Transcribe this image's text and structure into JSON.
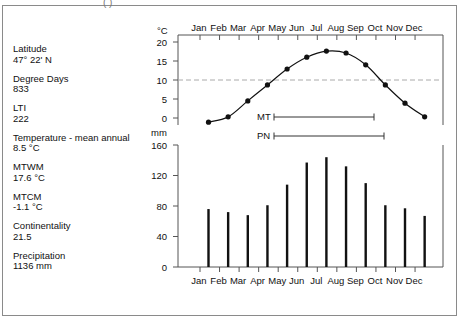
{
  "header": {
    "partial_title": "(          )"
  },
  "info": [
    {
      "label": "Latitude",
      "value": "47° 22'  N"
    },
    {
      "label": "Degree Days",
      "value": "833"
    },
    {
      "label": "LTI",
      "value": "222"
    },
    {
      "label": "Temperature - mean annual",
      "value": "8.5 °C"
    },
    {
      "label": "MTWM",
      "value": "17.6 °C"
    },
    {
      "label": "MTCM",
      "value": "-1.1 °C"
    },
    {
      "label": "Continentality",
      "value": "21.5"
    },
    {
      "label": "Precipitation",
      "value": "1136 mm"
    }
  ],
  "chart_data": [
    {
      "type": "line",
      "title": "Mean monthly temperature",
      "ylabel": "°C",
      "xlabel": "",
      "categories": [
        "Jan",
        "Feb",
        "Mar",
        "Apr",
        "May",
        "Jun",
        "Jul",
        "Aug",
        "Sep",
        "Oct",
        "Nov",
        "Dec"
      ],
      "values": [
        -1.1,
        0.3,
        4.5,
        8.7,
        12.9,
        16.0,
        17.6,
        17.1,
        14.0,
        8.7,
        3.9,
        0.3
      ],
      "yticks": [
        0,
        5,
        10,
        15,
        20
      ],
      "ylim": [
        -2,
        22
      ],
      "reference_line": {
        "y": 10,
        "style": "dashed",
        "color": "#aaaaaa"
      },
      "x_tick_labels_position": "top",
      "annotations": [
        {
          "label": "MT",
          "from_month": "Apr",
          "to_month": "Sep",
          "type": "range-bar"
        },
        {
          "label": "PN",
          "from_month": "Apr",
          "to_month": "Oct",
          "type": "range-bar"
        }
      ],
      "grid": false
    },
    {
      "type": "bar",
      "title": "Mean monthly precipitation",
      "ylabel": "mm",
      "xlabel": "",
      "categories": [
        "Jan",
        "Feb",
        "Mar",
        "Apr",
        "May",
        "Jun",
        "Jul",
        "Aug",
        "Sep",
        "Oct",
        "Nov",
        "Dec"
      ],
      "values": [
        76,
        72,
        68,
        81,
        108,
        137,
        144,
        132,
        110,
        81,
        77,
        67
      ],
      "yticks": [
        0,
        40,
        80,
        120,
        160
      ],
      "ylim": [
        0,
        160
      ],
      "x_tick_labels_position": "bottom",
      "grid": false
    }
  ],
  "axis": {
    "temp_unit": "°C",
    "precip_unit": "mm",
    "temp_ticks": [
      "20",
      "15",
      "10",
      "5",
      "0"
    ],
    "precip_ticks": [
      "160",
      "120",
      "80",
      "40",
      "0"
    ],
    "months": [
      "Jan",
      "Feb",
      "Mar",
      "Apr",
      "May",
      "Jun",
      "Jul",
      "Aug",
      "Sep",
      "Oct",
      "Nov",
      "Dec"
    ]
  },
  "legend": {
    "mt_label": "MT",
    "pn_label": "PN"
  },
  "colors": {
    "line": "#111111",
    "bars": "#111111",
    "axis": "#555555",
    "reference": "#aaaaaa",
    "frame": "#8a8a8a"
  }
}
